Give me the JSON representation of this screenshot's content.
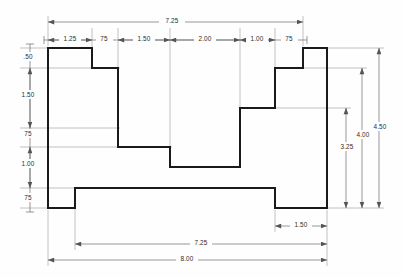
{
  "drawing": {
    "title": "stepped-block-orthographic-view",
    "units": "inches",
    "line_color": "#1a1a1a",
    "dim_color": "#6e6e6e",
    "text_color": "#2b2b2b",
    "background": "#fefefe"
  },
  "profile": {
    "description": "closed stepped outline",
    "points": "48,48 92,48 92,68 118,68 118,147 170,147 170,167 240,167 240,108 275,108 275,68 303,68 303,48 327,48 327,208 275,208 275,188 75,188 75,208 48,208 48,48"
  },
  "dimensions": {
    "top_overall": {
      "label": "7.25",
      "x1": 48,
      "x2": 303,
      "y": 22
    },
    "top_chain": [
      {
        "label": "1.25",
        "x1": 48,
        "x2": 92
      },
      {
        "label": "75",
        "x1": 92,
        "x2": 118
      },
      {
        "label": "1.50",
        "x1": 118,
        "x2": 170
      },
      {
        "label": "2.00",
        "x1": 170,
        "x2": 240
      },
      {
        "label": "1.00",
        "x1": 240,
        "x2": 275
      },
      {
        "label": "75",
        "x1": 275,
        "x2": 303
      }
    ],
    "left_chain": [
      {
        "label": ".50",
        "y1": 48,
        "y2": 68
      },
      {
        "label": "1.50",
        "y1": 68,
        "y2": 128
      },
      {
        "label": "75",
        "y1": 128,
        "y2": 147
      },
      {
        "label": "1.00",
        "y1": 147,
        "y2": 188
      },
      {
        "label": "75",
        "y1": 188,
        "y2": 208
      }
    ],
    "right_chain": [
      {
        "label": "3.25",
        "y1": 108,
        "y2": 208,
        "x": 346
      },
      {
        "label": "4.00",
        "y1": 68,
        "y2": 208,
        "x": 362
      },
      {
        "label": "4.50",
        "y1": 48,
        "y2": 208,
        "x": 379
      }
    ],
    "bottom": [
      {
        "label": "1.50",
        "x1": 275,
        "x2": 327,
        "y": 226
      },
      {
        "label": "7.25",
        "x1": 75,
        "x2": 327,
        "y": 244
      },
      {
        "label": "8.00",
        "x1": 48,
        "x2": 327,
        "y": 260
      }
    ]
  }
}
